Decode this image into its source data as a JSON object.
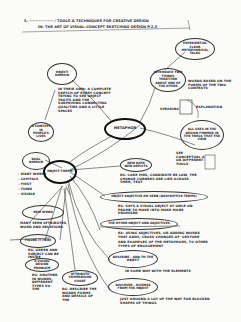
{
  "header": {
    "line1": "5. ~~~~~~~~ / TOOLS & TECHNIQUES FOR CREATIVE DESIGN",
    "line2": "IN: THE ART OF VISUAL-CONCEPT SKETCHING DESIGN P.2.3"
  },
  "center_node": "METAPHOR",
  "nodes": {
    "experiential": "EXPERIENTIAL CLEAR METAPHORICAL TALKS",
    "introduce": "INTRODUCE TWO THINGS TOGETHER ABOUT ONE OF THE OTHER",
    "object_domain": "OBJECT DOMAIN",
    "domain_desc": "IN THEIR OWN: A COMPLETE SKETCH OF EVERY CONCEPT TRYING TO SEE OBJECT TRAITS AND THE SURPRISING CONNECTING QUALITIES AND A LITTLE SPACES",
    "context": "A CONTEXT IN PEOPLE'S LIVES",
    "usage": "ALL USES IN THE DESIGN FORMED IN THE TOOLS THAT THE VIEW",
    "dual_domain": "DUAL DOMAIN",
    "attributes": "ATTRIBUTE COMPARISON CHART",
    "new_depict": "NEW DATA NEW DEPICTS",
    "object_forms": "OBJECT FORMS",
    "describe": "DESCRIBE - ADD TO THE OBJECT",
    "discover": "DISCOVER - DIVERSE FROM THE OBJECT",
    "object_adjective": "OBJECT ADJECTIVE OR VERB (DESCRIPTIVE TERMS)",
    "object_two": "THE OTHER OBJECT AND ADJECTIVES",
    "new_word": "NEW WORD",
    "figure": "FIGURE IT HERE",
    "visual": "A VISUAL DESIGN PROBLEM"
  },
  "annotations": {
    "a1": "WORDS BASED ON THE FORMS OF THE TWO CONTEXTS",
    "a2": "EXPLANATION",
    "a3": "SPEAKING",
    "a4": "SEE CONCEPTUAL A OR DIFFERENT TOOLS",
    "a5": "EG: CARE PINS, CANDIDATE BE LOW, THE CHANGE CORNERS ARE LIKE ACROSS THEM, TEXT",
    "a6": "EG: SAYS A VISUAL OBJECT AT ONCE ON FRAME TO MAKE INTO MAKE MORE PROMISED",
    "a7": "EX: USING ADJECTIVES, OR ADDING WORDS THAT ADDS, CROSS CHANGES OF 'GESTURE'",
    "a8": "AND EXAMPLES OF THE METAPHORS, TO OTHER TYPES OF ENGAGEMENT",
    "a9": "IN SOME WAY WITH THE ELEMENTS",
    "a10": "JUST AROUND A LOT OF THE WAY FOR BLOCKED SHAPES OF THINGS",
    "a11": "MANY SEEN ATTRIBUTES, WORD AND RELATIONS",
    "a12": "EG: GREEN AND SUBJECT CAN BE INSIDE",
    "a13": "EG: ANOTHER IN WORDS, DIFFERENT TYPES SO THE",
    "a14": "EG: DESCRIBE THE WORDS FORMS AND DETAILS OF THE",
    "bullets": [
      "- MANY WHERE",
      "- CAPITALS",
      "- FIRST",
      "- TOWN",
      "- VISIBLE"
    ]
  }
}
